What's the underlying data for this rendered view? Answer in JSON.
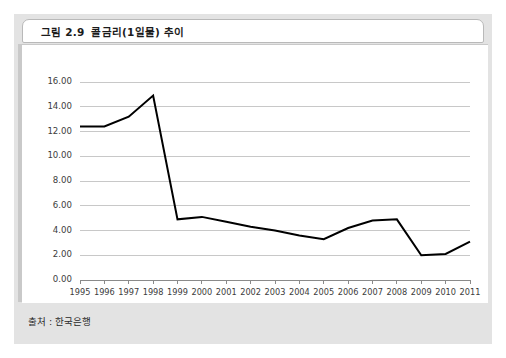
{
  "figure": {
    "label": "그림 2.9",
    "title": "콜금리(1일물) 추이",
    "source": "출처 : 한국은행"
  },
  "colors": {
    "panel_background": "#e3e3e3",
    "card_background": "#ffffff",
    "line_color": "#000000",
    "grid_color": "#c8c8c8",
    "axis_color": "#8a8a8a",
    "text_color": "#3c3c3c"
  },
  "chart_data": {
    "type": "line",
    "title": "콜금리(1일물) 추이",
    "xlabel": "",
    "ylabel": "",
    "ylim": [
      0.0,
      16.0
    ],
    "ytick_step": 2.0,
    "yticks": [
      "0.00",
      "2.00",
      "4.00",
      "6.00",
      "8.00",
      "10.00",
      "12.00",
      "14.00",
      "16.00"
    ],
    "grid": true,
    "legend": false,
    "categories": [
      "1995",
      "1996",
      "1997",
      "1998",
      "1999",
      "2000",
      "2001",
      "2002",
      "2003",
      "2004",
      "2005",
      "2006",
      "2007",
      "2008",
      "2009",
      "2010",
      "2011"
    ],
    "series": [
      {
        "name": "콜금리(1일물)",
        "values": [
          12.4,
          12.4,
          13.2,
          14.9,
          4.9,
          5.1,
          4.7,
          4.3,
          4.0,
          3.6,
          3.3,
          4.2,
          4.8,
          4.9,
          2.0,
          2.1,
          3.1
        ]
      }
    ]
  }
}
